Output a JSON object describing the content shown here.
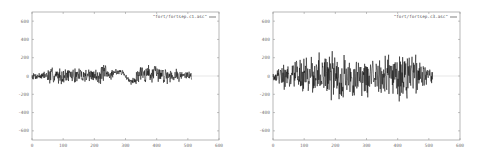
{
  "chart_data": [
    {
      "type": "line",
      "title": "",
      "xlabel": "",
      "ylabel": "",
      "legend": [
        "\"fort/fortsep.c1.asc\""
      ],
      "legend_position": "top-right",
      "grid": false,
      "xlim": [
        0,
        600
      ],
      "ylim": [
        -700,
        700
      ],
      "xticks": [
        "0",
        "100",
        "200",
        "300",
        "400",
        "500",
        "600"
      ],
      "yticks": [
        "600",
        "400",
        "200",
        "0",
        "-200",
        "-400",
        "-600"
      ],
      "series": [
        {
          "name": "\"fort/fortsep.c1.asc\"",
          "color": "#000000",
          "x_range": [
            0,
            512
          ],
          "envelope_x": [
            0,
            40,
            60,
            100,
            150,
            200,
            230,
            250,
            270,
            290,
            310,
            330,
            350,
            370,
            400,
            450,
            480,
            512
          ],
          "envelope_amp": [
            40,
            60,
            120,
            90,
            100,
            90,
            140,
            80,
            40,
            30,
            30,
            60,
            130,
            120,
            110,
            100,
            70,
            60
          ],
          "trend_x": [
            0,
            250,
            270,
            290,
            300,
            315,
            330,
            345,
            512
          ],
          "trend_y": [
            0,
            10,
            50,
            40,
            0,
            -60,
            -40,
            30,
            0
          ],
          "seed": 7
        }
      ]
    },
    {
      "type": "line",
      "title": "",
      "xlabel": "",
      "ylabel": "",
      "legend": [
        "\"fort/fortsep.c3.asc\""
      ],
      "legend_position": "top-right",
      "grid": false,
      "xlim": [
        0,
        600
      ],
      "ylim": [
        -700,
        700
      ],
      "xticks": [
        "0",
        "100",
        "200",
        "300",
        "400",
        "500",
        "600"
      ],
      "yticks": [
        "600",
        "400",
        "200",
        "0",
        "-200",
        "-400",
        "-600"
      ],
      "series": [
        {
          "name": "\"fort/fortsep.c3.asc\"",
          "color": "#000000",
          "x_range": [
            0,
            512
          ],
          "envelope_x": [
            0,
            30,
            60,
            100,
            150,
            200,
            225,
            250,
            300,
            350,
            400,
            420,
            450,
            480,
            512
          ],
          "envelope_amp": [
            50,
            150,
            200,
            230,
            300,
            280,
            380,
            250,
            260,
            240,
            300,
            330,
            280,
            180,
            70
          ],
          "trend_x": [
            0,
            512
          ],
          "trend_y": [
            0,
            0
          ],
          "seed": 19
        }
      ]
    }
  ]
}
